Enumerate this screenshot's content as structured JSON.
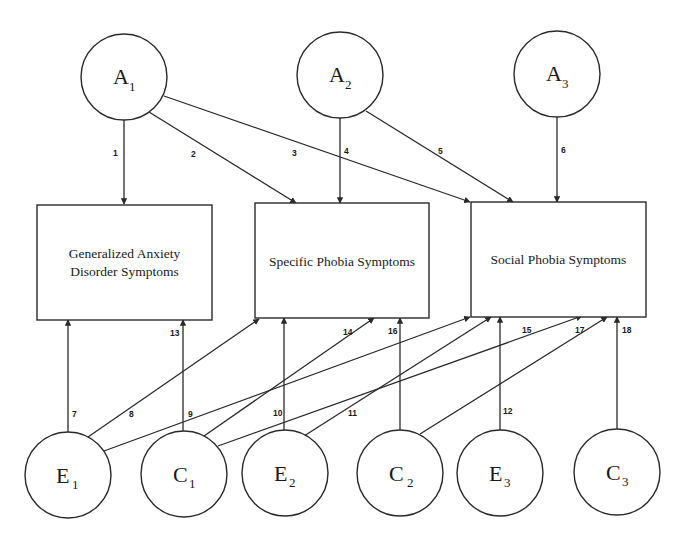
{
  "diagram": {
    "type": "path-model",
    "latents_top": [
      {
        "id": "A1",
        "letter": "A",
        "sub": "1"
      },
      {
        "id": "A2",
        "letter": "A",
        "sub": "2"
      },
      {
        "id": "A3",
        "letter": "A",
        "sub": "3"
      }
    ],
    "latents_bottom": [
      {
        "id": "E1",
        "letter": "E",
        "sub": "1"
      },
      {
        "id": "C1",
        "letter": "C",
        "sub": "1"
      },
      {
        "id": "E2",
        "letter": "E",
        "sub": "2"
      },
      {
        "id": "C2",
        "letter": "C",
        "sub": "2"
      },
      {
        "id": "E3",
        "letter": "E",
        "sub": "3"
      },
      {
        "id": "C3",
        "letter": "C",
        "sub": "3"
      }
    ],
    "observed": [
      {
        "id": "GAD",
        "line1": "Generalized Anxiety",
        "line2": "Disorder Symptoms"
      },
      {
        "id": "SPEC",
        "line1": "Specific Phobia Symptoms"
      },
      {
        "id": "SOC",
        "line1": "Social Phobia Symptoms"
      }
    ],
    "paths": [
      {
        "num": "1",
        "from": "A1",
        "to": "GAD"
      },
      {
        "num": "2",
        "from": "A1",
        "to": "SPEC"
      },
      {
        "num": "3",
        "from": "A1",
        "to": "SOC"
      },
      {
        "num": "4",
        "from": "A2",
        "to": "SPEC"
      },
      {
        "num": "5",
        "from": "A2",
        "to": "SOC"
      },
      {
        "num": "6",
        "from": "A3",
        "to": "SOC"
      },
      {
        "num": "7",
        "from": "E1",
        "to": "GAD"
      },
      {
        "num": "8",
        "from": "E1",
        "to": "SPEC"
      },
      {
        "num": "9",
        "from": "E1",
        "to": "SOC"
      },
      {
        "num": "10",
        "from": "E2",
        "to": "SPEC"
      },
      {
        "num": "11",
        "from": "E2",
        "to": "SOC"
      },
      {
        "num": "12",
        "from": "E3",
        "to": "SOC"
      },
      {
        "num": "13",
        "from": "C1",
        "to": "GAD"
      },
      {
        "num": "14",
        "from": "C1",
        "to": "SPEC"
      },
      {
        "num": "15",
        "from": "C1",
        "to": "SOC"
      },
      {
        "num": "16",
        "from": "C2",
        "to": "SPEC"
      },
      {
        "num": "17",
        "from": "C2",
        "to": "SOC"
      },
      {
        "num": "18",
        "from": "C3",
        "to": "SOC"
      }
    ]
  }
}
